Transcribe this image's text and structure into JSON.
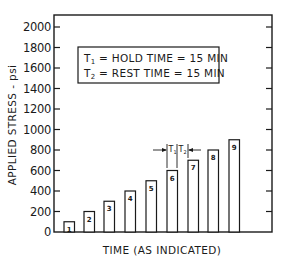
{
  "chart_data": {
    "type": "bar",
    "title": "",
    "xlabel": "TIME (AS INDICATED)",
    "ylabel": "APPLIED STRESS - psi",
    "ylim": [
      0,
      2000
    ],
    "yticks": [
      0,
      200,
      400,
      600,
      800,
      1000,
      1200,
      1400,
      1600,
      1800,
      2000
    ],
    "ytick_labels": [
      "0",
      "200",
      "400",
      "600",
      "800",
      "1000",
      "1200",
      "1400",
      "1600",
      "1800",
      "2000"
    ],
    "grid": false,
    "categories": [
      "1",
      "2",
      "3",
      "4",
      "5",
      "6",
      "7",
      "8",
      "9"
    ],
    "values": [
      100,
      200,
      300,
      400,
      500,
      600,
      700,
      800,
      900
    ],
    "legend": {
      "position": "upper-left inset box",
      "lines": [
        "T1 = HOLD TIME = 15 MIN",
        "T2 = REST TIME = 15 MIN"
      ]
    },
    "annotations": [
      {
        "label": "T1",
        "meaning": "hold time (width of bar 6)"
      },
      {
        "label": "T2",
        "meaning": "rest time (gap between bar 6 and bar 7)"
      }
    ]
  },
  "legend": {
    "t1_sym": "T",
    "t1_sub": "1",
    "t1_text": " = HOLD TIME = 15 MIN",
    "t2_sym": "T",
    "t2_sub": "2",
    "t2_text": " = REST TIME = 15 MIN"
  },
  "annotation": {
    "t1": "T",
    "t1_sub": "1",
    "t2": "T",
    "t2_sub": "2"
  },
  "colors": {
    "ink": "#1a1a1a",
    "background": "#ffffff"
  }
}
